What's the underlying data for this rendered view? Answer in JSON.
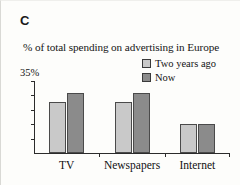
{
  "figure": {
    "panel_label": "C",
    "subtitle": "% of total spending on advertising in Europe",
    "y_axis_top_label": "35%",
    "colors": {
      "light_series": "#c9c9c9",
      "dark_series": "#8b8b8b",
      "axis": "#2b2b2b",
      "background": "#fdfdfb",
      "text": "#141414"
    }
  },
  "chart_data": {
    "type": "bar",
    "title": "% of total spending on advertising in Europe",
    "xlabel": "",
    "ylabel": "",
    "categories": [
      "TV",
      "Newspapers",
      "Internet"
    ],
    "series": [
      {
        "name": "Two years ago",
        "color": "#c9c9c9",
        "values": [
          25,
          25,
          14
        ]
      },
      {
        "name": "Now",
        "color": "#8b8b8b",
        "values": [
          29,
          29,
          14
        ]
      }
    ],
    "ylim": [
      0,
      35
    ],
    "yticks": [
      0,
      7,
      14,
      21,
      28,
      35
    ],
    "ytick_labels": [
      "",
      "",
      "",
      "",
      "",
      "35%"
    ],
    "grid": false,
    "legend_position": "top-right",
    "legend_entries": [
      "Two years ago",
      "Now"
    ]
  }
}
